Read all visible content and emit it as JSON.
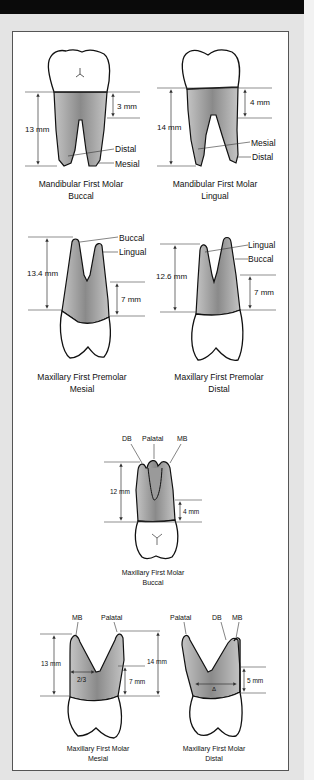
{
  "figures": [
    {
      "id": "mandibular-first-molar-buccal",
      "caption": [
        "Mandibular First Molar",
        "Buccal"
      ],
      "measurements": [
        "13 mm",
        "3 mm"
      ],
      "labels": [
        "Distal",
        "Mesial"
      ]
    },
    {
      "id": "mandibular-first-molar-lingual",
      "caption": [
        "Mandibular First Molar",
        "Lingual"
      ],
      "measurements": [
        "14 mm",
        "4 mm"
      ],
      "labels": [
        "Mesial",
        "Distal"
      ]
    },
    {
      "id": "maxillary-first-premolar-mesial",
      "caption": [
        "Maxillary First Premolar",
        "Mesial"
      ],
      "measurements": [
        "13.4 mm",
        "7 mm"
      ],
      "labels": [
        "Buccal",
        "Lingual"
      ]
    },
    {
      "id": "maxillary-first-premolar-distal",
      "caption": [
        "Maxillary First Premolar",
        "Distal"
      ],
      "measurements": [
        "12.6 mm",
        "7 mm"
      ],
      "labels": [
        "Lingual",
        "Buccal"
      ]
    },
    {
      "id": "maxillary-first-molar-buccal",
      "caption": [
        "Maxillary First Molar",
        "Buccal"
      ],
      "measurements": [
        "12 mm",
        "4 mm"
      ],
      "labels": [
        "DB",
        "Palatal",
        "MB"
      ]
    },
    {
      "id": "maxillary-first-molar-mesial",
      "caption": [
        "Maxillary First Molar",
        "Mesial"
      ],
      "measurements": [
        "13 mm",
        "14 mm",
        "7 mm",
        "2/3"
      ],
      "labels": [
        "MB",
        "Palatal"
      ]
    },
    {
      "id": "maxillary-first-molar-distal",
      "caption": [
        "Maxillary First Molar",
        "Distal"
      ],
      "measurements": [
        "5 mm"
      ],
      "labels": [
        "Palatal",
        "DB",
        "MB"
      ]
    }
  ],
  "colors": {
    "topbar": "#0a0a0a",
    "background": "#e4e4e4",
    "panel": "#ffffff",
    "root_fill": "#b8b8b8",
    "root_dark": "#7a7a7a"
  }
}
